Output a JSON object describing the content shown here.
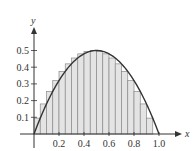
{
  "chart_data": {
    "type": "bar",
    "title": "",
    "xlabel": "x",
    "ylabel": "y",
    "xlim": [
      0,
      1.0
    ],
    "ylim": [
      0,
      0.5
    ],
    "xticks": [
      "0.2",
      "0.4",
      "0.6",
      "0.8",
      "1.0"
    ],
    "yticks": [
      "0.1",
      "0.2",
      "0.3",
      "0.4",
      "0.5"
    ],
    "grid": false,
    "legend": null,
    "curve": {
      "function": "y = 2x(1 - x)",
      "max": 0.5,
      "max_at": 0.5
    },
    "rectangles": {
      "count": 20,
      "width": 0.05,
      "left_edges": [
        0,
        0.05,
        0.1,
        0.15,
        0.2,
        0.25,
        0.3,
        0.35,
        0.4,
        0.45,
        0.5,
        0.55,
        0.6,
        0.65,
        0.7,
        0.75,
        0.8,
        0.85,
        0.9,
        0.95
      ],
      "heights": [
        0.095,
        0.18,
        0.255,
        0.32,
        0.375,
        0.42,
        0.455,
        0.48,
        0.495,
        0.5,
        0.495,
        0.48,
        0.455,
        0.42,
        0.375,
        0.32,
        0.255,
        0.18,
        0.095,
        0
      ]
    }
  },
  "colors": {
    "rect_fill": "#e4e4e4",
    "rect_stroke": "#8a8a8a",
    "curve": "#333333",
    "axis": "#333333"
  }
}
